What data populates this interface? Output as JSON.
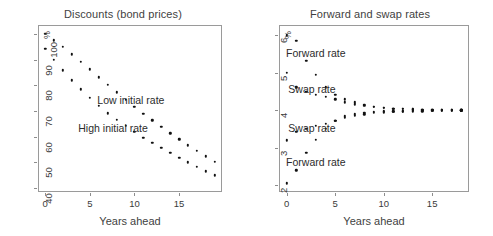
{
  "figure": {
    "panels": [
      "left",
      "right"
    ]
  },
  "left_panel": {
    "title": "Discounts (bond prices)",
    "xlabel": "Years ahead",
    "unit_label": "%",
    "yticks": [
      "40",
      "50",
      "60",
      "70",
      "80",
      "90",
      "100"
    ],
    "xticks": [
      "0",
      "5",
      "10",
      "15"
    ],
    "annotations": [
      {
        "text": "Low initial rate",
        "x": 9.6,
        "y": 74.5
      },
      {
        "text": "High initial rate",
        "x": 7.6,
        "y": 63.5
      }
    ]
  },
  "right_panel": {
    "title": "Forward and swap rates",
    "xlabel": "Years ahead",
    "unit_label": "%",
    "yticks": [
      "2",
      "3",
      "4",
      "5",
      "6"
    ],
    "xticks": [
      "0",
      "5",
      "10",
      "15"
    ],
    "annotations": [
      {
        "text": "Forward rate",
        "x": 3.0,
        "y": 5.52
      },
      {
        "text": "Swap rate",
        "x": 2.6,
        "y": 4.58
      },
      {
        "text": "Swap rate",
        "x": 2.6,
        "y": 3.52
      },
      {
        "text": "Forward rate",
        "x": 3.0,
        "y": 2.62
      }
    ]
  },
  "chart_data": [
    {
      "type": "scatter",
      "title": "Discounts (bond prices)",
      "xlabel": "Years ahead",
      "ylabel": "%",
      "xlim": [
        -0.8,
        19.8
      ],
      "ylim": [
        38.5,
        103.5
      ],
      "xticks": [
        0,
        5,
        10,
        15
      ],
      "yticks": [
        40,
        50,
        60,
        70,
        80,
        90,
        100
      ],
      "grid": false,
      "legend": "annotated-inline",
      "x": [
        0,
        1,
        2,
        3,
        4,
        5,
        6,
        7,
        8,
        9,
        10,
        11,
        12,
        13,
        14,
        15,
        16,
        17,
        18,
        19
      ],
      "series": [
        {
          "name": "Low initial rate",
          "values": [
            100.0,
            97.5,
            95.1,
            92.1,
            89.2,
            86.2,
            83.2,
            80.2,
            77.3,
            74.5,
            71.7,
            69.0,
            66.4,
            63.8,
            61.4,
            59.0,
            56.7,
            54.5,
            52.4,
            50.3
          ]
        },
        {
          "name": "High initial rate",
          "values": [
            94.2,
            90.0,
            85.8,
            82.0,
            78.4,
            75.1,
            72.0,
            69.2,
            66.6,
            64.2,
            61.9,
            59.7,
            57.6,
            55.6,
            53.7,
            51.8,
            50.0,
            48.2,
            46.6,
            45.0
          ]
        }
      ]
    },
    {
      "type": "scatter",
      "title": "Forward and swap rates",
      "xlabel": "Years ahead",
      "ylabel": "%",
      "xlim": [
        -0.8,
        18.8
      ],
      "ylim": [
        1.82,
        6.28
      ],
      "xticks": [
        0,
        5,
        10,
        15
      ],
      "yticks": [
        2,
        3,
        4,
        5,
        6
      ],
      "grid": false,
      "legend": "annotated-inline",
      "x": [
        0,
        1,
        2,
        3,
        4,
        5,
        6,
        7,
        8,
        9,
        10,
        11,
        12,
        13,
        14,
        15,
        16,
        17,
        18
      ],
      "series": [
        {
          "name": "Forward rate (high initial)",
          "values": [
            6.0,
            5.85,
            5.32,
            4.95,
            4.62,
            4.42,
            4.3,
            4.22,
            4.15,
            4.1,
            4.07,
            4.05,
            4.04,
            4.03,
            4.02,
            4.02,
            4.01,
            4.01,
            4.0
          ]
        },
        {
          "name": "Swap rate (high initial)",
          "values": [
            5.0,
            4.62,
            4.5,
            4.42,
            4.36,
            4.3,
            4.22,
            4.16,
            4.12,
            4.09,
            4.07,
            4.05,
            4.04,
            4.03,
            4.02,
            4.02,
            4.01,
            4.01,
            4.0
          ]
        },
        {
          "name": "Swap rate (low initial)",
          "values": [
            3.2,
            3.42,
            3.5,
            3.58,
            3.64,
            3.72,
            3.8,
            3.86,
            3.9,
            3.93,
            3.95,
            3.96,
            3.97,
            3.98,
            3.98,
            3.99,
            3.99,
            3.99,
            4.0
          ]
        },
        {
          "name": "Forward rate (low initial)",
          "values": [
            2.05,
            2.4,
            2.87,
            3.22,
            3.5,
            3.72,
            3.84,
            3.9,
            3.94,
            3.96,
            3.97,
            3.98,
            3.98,
            3.99,
            3.99,
            3.99,
            4.0,
            4.0,
            4.0
          ]
        }
      ]
    }
  ]
}
